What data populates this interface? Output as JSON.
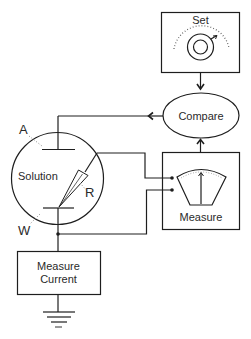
{
  "diagram": {
    "type": "electrochemical control loop schematic",
    "colors": {
      "line": "#1e1e1e",
      "background": "#ffffff",
      "dotted": "#8a8a8a"
    },
    "nodes": {
      "set": {
        "label": "Set",
        "icon": "dial-knob-icon"
      },
      "compare": {
        "label": "Compare"
      },
      "measure": {
        "label": "Measure",
        "icon": "meter-gauge-icon"
      },
      "solution": {
        "label": "Solution"
      },
      "measure_current": {
        "label_line1": "Measure",
        "label_line2": "Current"
      },
      "ground": {
        "icon": "ground-icon"
      }
    },
    "electrodes": {
      "auxiliary": {
        "label": "A"
      },
      "reference": {
        "label": "R"
      },
      "working": {
        "label": "W"
      }
    },
    "edges": [
      {
        "from": "set",
        "to": "compare",
        "arrow": true
      },
      {
        "from": "measure",
        "to": "compare",
        "arrow": true
      },
      {
        "from": "compare",
        "to": "auxiliary",
        "arrow": true
      },
      {
        "from": "reference",
        "to": "measure",
        "arrow": false
      },
      {
        "from": "working",
        "to": "measure",
        "arrow": false
      },
      {
        "from": "working",
        "to": "measure_current",
        "arrow": false
      },
      {
        "from": "measure_current",
        "to": "ground",
        "arrow": false
      }
    ]
  }
}
